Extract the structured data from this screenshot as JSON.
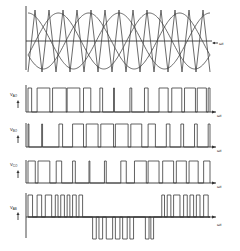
{
  "x_axis_label": "ωt",
  "panels": [
    {
      "id": "carrier-reference",
      "description": "Three-phase sinusoidal references with triangular carrier",
      "x_label": "ωt",
      "reference_periods": 2,
      "carrier_periods": 13,
      "phase_shift_deg": 120
    },
    {
      "id": "v-ao",
      "label_main": "V",
      "label_sub": "AO",
      "x_label": "ωt",
      "pulses": [
        [
          0.0,
          0.02
        ],
        [
          0.05,
          0.12
        ],
        [
          0.135,
          0.21
        ],
        [
          0.215,
          0.285
        ],
        [
          0.305,
          0.345
        ],
        [
          0.395,
          0.41
        ],
        [
          0.47,
          0.475
        ],
        [
          0.56,
          0.57
        ],
        [
          0.64,
          0.66
        ],
        [
          0.72,
          0.77
        ],
        [
          0.79,
          0.845
        ],
        [
          0.86,
          0.92
        ],
        [
          0.93,
          0.98
        ],
        [
          0.99,
          1.0
        ]
      ]
    },
    {
      "id": "v-bo",
      "label_main": "V",
      "label_sub": "BO",
      "x_label": "ωt",
      "pulses": [
        [
          0.0,
          0.005
        ],
        [
          0.075,
          0.08
        ],
        [
          0.17,
          0.19
        ],
        [
          0.245,
          0.305
        ],
        [
          0.32,
          0.385
        ],
        [
          0.4,
          0.47
        ],
        [
          0.48,
          0.55
        ],
        [
          0.565,
          0.625
        ],
        [
          0.66,
          0.7
        ],
        [
          0.76,
          0.78
        ],
        [
          0.84,
          0.855
        ],
        [
          0.915,
          0.93
        ],
        [
          0.99,
          1.0
        ]
      ]
    },
    {
      "id": "v-co",
      "label_main": "V",
      "label_sub": "CO",
      "x_label": "ωt",
      "pulses": [
        [
          0.0,
          0.04
        ],
        [
          0.055,
          0.12
        ],
        [
          0.155,
          0.185
        ],
        [
          0.245,
          0.26
        ],
        [
          0.335,
          0.34
        ],
        [
          0.42,
          0.43
        ],
        [
          0.51,
          0.54
        ],
        [
          0.585,
          0.65
        ],
        [
          0.66,
          0.72
        ],
        [
          0.74,
          0.8
        ],
        [
          0.815,
          0.87
        ],
        [
          0.885,
          0.935
        ],
        [
          0.965,
          1.0
        ]
      ]
    },
    {
      "id": "v-ab",
      "label_main": "V",
      "label_sub": "AB",
      "x_label": "ωt",
      "positive_pulses": [
        [
          0.0,
          0.025
        ],
        [
          0.05,
          0.075
        ],
        [
          0.095,
          0.13
        ],
        [
          0.15,
          0.165
        ],
        [
          0.18,
          0.2
        ],
        [
          0.215,
          0.23
        ],
        [
          0.245,
          0.265
        ],
        [
          0.28,
          0.3
        ]
      ],
      "negative_pulses": [
        [
          0.355,
          0.375
        ],
        [
          0.39,
          0.41
        ],
        [
          0.43,
          0.465
        ],
        [
          0.48,
          0.505
        ],
        [
          0.52,
          0.545
        ],
        [
          0.56,
          0.58
        ],
        [
          0.645,
          0.665
        ],
        [
          0.675,
          0.69
        ]
      ],
      "positive_pulses_2": [
        [
          0.735,
          0.75
        ],
        [
          0.765,
          0.785
        ],
        [
          0.8,
          0.835
        ],
        [
          0.855,
          0.875
        ],
        [
          0.89,
          0.91
        ],
        [
          0.925,
          0.945
        ],
        [
          0.965,
          0.99
        ]
      ]
    }
  ],
  "colors": {
    "line": "#3a3a3a",
    "background": "#ffffff"
  }
}
